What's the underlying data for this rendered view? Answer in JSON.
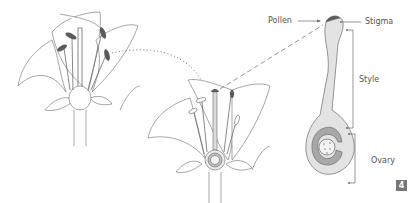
{
  "diagram": {
    "type": "botanical-illustration",
    "panels": [
      {
        "name": "whole-flower",
        "description": "Lily flower with stamens and anthers"
      },
      {
        "name": "cutaway-flower",
        "description": "Second flower with pistil exposed, ovary highlighted"
      },
      {
        "name": "pistil-detail",
        "description": "Enlarged pistil showing pollen on stigma, style and ovary"
      }
    ],
    "labels": {
      "pollen": "Pollen",
      "stigma": "Stigma",
      "style": "Style",
      "ovary": "Ovary"
    },
    "figure_number": "4",
    "colors": {
      "outline": "#6b6b6b",
      "anther": "#5a5a5a",
      "pistil_fill": "#e3e3e3",
      "ovary_ring": "#a8a8a8",
      "badge": "#777777"
    }
  }
}
